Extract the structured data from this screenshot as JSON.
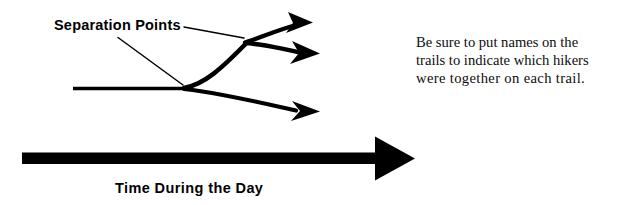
{
  "figure": {
    "background_color": "#ffffff",
    "ink_color": "#000000",
    "width": 617,
    "height": 205
  },
  "annotations": {
    "separation_points_label": "Separation Points",
    "time_axis_label": "Time During the Day"
  },
  "note": {
    "line1": "Be sure to put names on the",
    "line2": "trails to indicate which hikers",
    "line3": "were together on each trail."
  },
  "diagram_data": {
    "type": "branching-timeline",
    "axis": {
      "name": "time-axis",
      "label": "Time During the Day",
      "direction": "left-to-right",
      "shaft_from_x": 22,
      "shaft_to_x": 378,
      "shaft_y": 158,
      "arrow_tip_x": 415
    },
    "trunk": {
      "name": "main-trail",
      "start": [
        73,
        88
      ],
      "end": [
        185,
        88
      ]
    },
    "separation_points": [
      {
        "id": "fork-1",
        "x": 185,
        "y": 88,
        "branches": 2
      },
      {
        "id": "fork-2",
        "x": 245,
        "y": 42,
        "branches": 2
      }
    ],
    "branches": [
      {
        "id": "branch-upper-a",
        "from": [
          245,
          42
        ],
        "to": [
          310,
          22
        ],
        "has_arrowhead": true
      },
      {
        "id": "branch-upper-b",
        "from": [
          245,
          42
        ],
        "to": [
          318,
          53
        ],
        "has_arrowhead": true
      },
      {
        "id": "branch-lower",
        "from": [
          185,
          88
        ],
        "to": [
          318,
          112
        ],
        "has_arrowhead": true
      }
    ],
    "leader_lines": [
      {
        "id": "leader-to-fork-1",
        "from": [
          118,
          37
        ],
        "to": [
          183,
          85
        ]
      },
      {
        "id": "leader-to-fork-2",
        "from": [
          184,
          27
        ],
        "to": [
          243,
          38
        ]
      }
    ]
  }
}
